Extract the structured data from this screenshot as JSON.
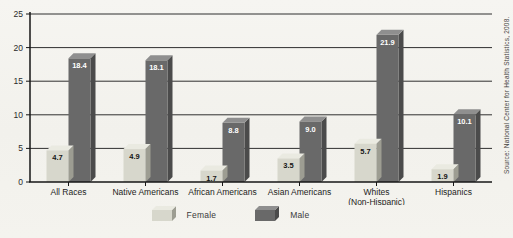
{
  "chart_data": {
    "type": "bar",
    "title": "",
    "categories": [
      "All Races",
      "Native Americans",
      "African Americans",
      "Asian Americans",
      "Whites (Non-Hispanic)",
      "Hispanics"
    ],
    "series": [
      {
        "name": "Female",
        "values": [
          4.7,
          4.9,
          1.7,
          3.5,
          5.7,
          1.9
        ]
      },
      {
        "name": "Male",
        "values": [
          18.4,
          18.1,
          8.8,
          9.0,
          21.9,
          10.1
        ]
      }
    ],
    "xlabel": "",
    "ylabel": "",
    "ylim": [
      0,
      25
    ],
    "yticks": [
      0,
      5,
      10,
      15,
      20,
      25
    ],
    "grid": true,
    "value_labels": true,
    "legend_position": "bottom",
    "bar_style": "3d"
  },
  "legend": {
    "items": [
      {
        "label": "Female"
      },
      {
        "label": "Male"
      }
    ]
  },
  "source_note": "Source: National Center for Health Statistics, 2008.",
  "colors": {
    "female": {
      "front": "#d7d7cc",
      "top": "#eaeae1",
      "side": "#9d9d92"
    },
    "male": {
      "front": "#696969",
      "top": "#8f8f8f",
      "side": "#4b4b4b"
    },
    "female_value_label": "#141414",
    "male_value_label": "#ffffff",
    "grid": "#2f2f2f",
    "axis": "#161616",
    "tick_label": "#2a2a2a",
    "category_label": "#1d1d1b"
  }
}
